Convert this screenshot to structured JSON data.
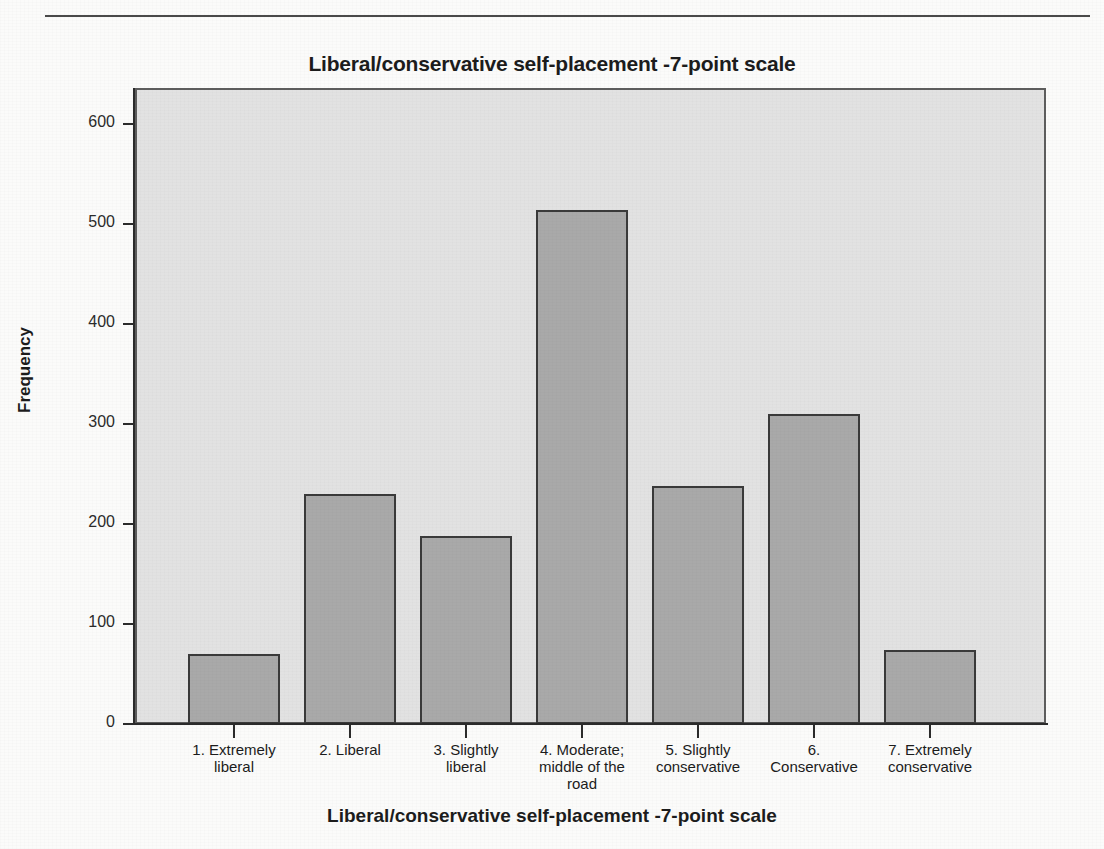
{
  "chart_data": {
    "type": "bar",
    "title": "Liberal/conservative self-placement -7-point scale",
    "xlabel": "Liberal/conservative self-placement -7-point scale",
    "ylabel": "Frequency",
    "categories": [
      "1. Extremely liberal",
      "2. Liberal",
      "3. Slightly liberal",
      "4. Moderate; middle of the road",
      "5. Slightly conservative",
      "6. Conservative",
      "7. Extremely conservative"
    ],
    "category_lines": [
      [
        "1. Extremely",
        "liberal"
      ],
      [
        "2. Liberal"
      ],
      [
        "3. Slightly",
        "liberal"
      ],
      [
        "4. Moderate;",
        "middle of the",
        "road"
      ],
      [
        "5. Slightly",
        "conservative"
      ],
      [
        "6.",
        "Conservative"
      ],
      [
        "7. Extremely",
        "conservative"
      ]
    ],
    "values": [
      70,
      230,
      188,
      514,
      238,
      310,
      74
    ],
    "ylim": [
      0,
      640
    ],
    "yticks": [
      0,
      100,
      200,
      300,
      400,
      500,
      600
    ],
    "ytick_labels": [
      "0",
      "100",
      "200",
      "300",
      "400",
      "500",
      "600"
    ],
    "grid": false,
    "legend": "none",
    "bar_color": "#a9a9a9",
    "bar_border_color": "#3a3a3a",
    "plot_background": "#e2e2e2",
    "axis_color": "#2b2b2b"
  },
  "geometry": {
    "plot_left": 135,
    "plot_right": 1046,
    "baseline_y": 724,
    "top_y": 124,
    "units_per_pixel": 1,
    "bar_centers": [
      234,
      350,
      466,
      582,
      698,
      814,
      930
    ],
    "bar_width": 92
  }
}
